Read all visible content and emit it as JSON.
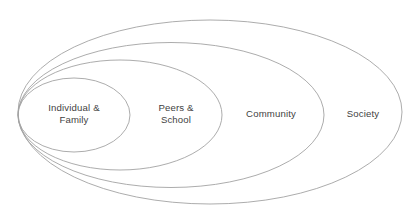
{
  "diagram": {
    "type": "nested-ellipse-diagram",
    "background_color": "#ffffff",
    "stroke_color": "#a3a3a3",
    "stroke_width": 0.9,
    "text_color": "#3f3f3f",
    "canvas": {
      "width": 419,
      "height": 220
    },
    "rings": [
      {
        "id": "individual-family",
        "label": "Individual &\nFamily",
        "level": 1,
        "ellipse": {
          "cx": 74,
          "cy": 115,
          "rx": 56,
          "ry": 37
        },
        "label_position": {
          "x": 74,
          "y": 114
        }
      },
      {
        "id": "peers-school",
        "label": "Peers &\nSchool",
        "level": 2,
        "ellipse": {
          "cx": 120,
          "cy": 115,
          "rx": 102,
          "ry": 55
        },
        "label_position": {
          "x": 176,
          "y": 114
        }
      },
      {
        "id": "community",
        "label": "Community",
        "level": 3,
        "ellipse": {
          "cx": 171,
          "cy": 115,
          "rx": 153,
          "ry": 72.5
        },
        "label_position": {
          "x": 271,
          "y": 114
        }
      },
      {
        "id": "society",
        "label": "Society",
        "level": 4,
        "ellipse": {
          "cx": 210,
          "cy": 112,
          "rx": 192,
          "ry": 92
        },
        "label_position": {
          "x": 363,
          "y": 114
        }
      }
    ]
  }
}
